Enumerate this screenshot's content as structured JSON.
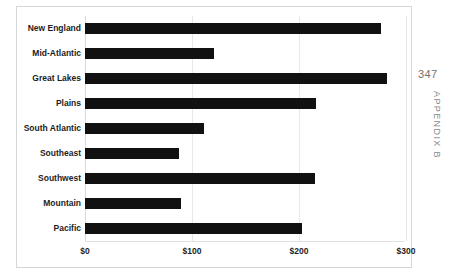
{
  "page": {
    "folio": "347",
    "running_head": "APPENDIX B"
  },
  "colors": {
    "bar": "#111111",
    "gridline": "#e8e8e8",
    "frame_border": "#d6d6d6",
    "text": "#1d1d1d",
    "folio_text": "#6f6f6f",
    "running_head_text": "#8a8a8a",
    "plot_background": "#ffffff"
  },
  "chart_data": {
    "type": "bar",
    "orientation": "horizontal",
    "title": "",
    "subtitle": "",
    "xlabel": "",
    "ylabel": "",
    "grid": true,
    "legend": false,
    "legend_position": "none",
    "xlim": [
      0,
      300
    ],
    "xticks": [
      0,
      100,
      200,
      300
    ],
    "xtick_labels": [
      "$0",
      "$100",
      "$200",
      "$300"
    ],
    "categories": [
      "New England",
      "Mid-Atlantic",
      "Great Lakes",
      "Plains",
      "South Atlantic",
      "Southeast",
      "Southwest",
      "Mountain",
      "Pacific"
    ],
    "values": [
      277,
      121,
      282,
      216,
      111,
      88,
      215,
      90,
      203
    ],
    "series": [
      {
        "name": "",
        "values": [
          277,
          121,
          282,
          216,
          111,
          88,
          215,
          90,
          203
        ]
      }
    ]
  }
}
